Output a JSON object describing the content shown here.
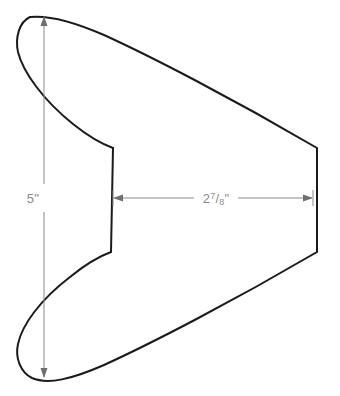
{
  "drawing": {
    "title": "Boomerang part outline with dimensions",
    "background_color": "#ffffff",
    "outline_color": "#1a1a1a",
    "dimension_color": "#8a8a8a",
    "dimensions": [
      {
        "name": "height",
        "label": "5\"",
        "value": "5",
        "unit": "\"",
        "orientation": "vertical",
        "from": [
          44,
          16
        ],
        "to": [
          44,
          378
        ]
      },
      {
        "name": "width",
        "label": "2 7/8\"",
        "whole": "2",
        "numerator": "7",
        "separator": "/",
        "denominator": "8",
        "unit": "\"",
        "orientation": "horizontal",
        "from": [
          113,
          198
        ],
        "to": [
          313,
          198
        ]
      }
    ]
  },
  "chart_data": {
    "type": "diagram",
    "shape_path": "M 30 17 C 48 15 72 21 104 35 C 150 56 230 97 317 148 L 317 252 C 230 303 150 344 104 365 C 72 379 48 385 32 378 C 20 372 15 357 18 344 C 22 325 40 300 70 277 C 86 264 100 256 111 252 L 113 148 C 102 144 88 136 73 124 C 43 100 23 72 18 52 C 15 38 19 22 30 17 Z",
    "vertices": {
      "top_cusp": [
        30,
        17
      ],
      "bottom_cusp": [
        32,
        378
      ],
      "left_upper_bulge": [
        17,
        50
      ],
      "left_lower_bulge": [
        18,
        345
      ],
      "notch_top": [
        113,
        148
      ],
      "notch_bottom": [
        111,
        252
      ],
      "right_top_corner": [
        317,
        148
      ],
      "right_bottom_corner": [
        317,
        252
      ]
    },
    "annotations": [
      "5\"",
      "2 7/8\""
    ]
  }
}
